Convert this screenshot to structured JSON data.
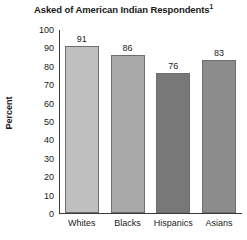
{
  "chart_data": {
    "type": "bar",
    "title": "Asked of American Indian Respondents",
    "title_superscript": "1",
    "categories": [
      "Whites",
      "Blacks",
      "Hispanics",
      "Asians"
    ],
    "values": [
      91,
      86,
      76,
      83
    ],
    "xlabel": "",
    "ylabel": "Percent",
    "ylim": [
      0,
      100
    ],
    "yticks": [
      100,
      90,
      80,
      70,
      60,
      50,
      40,
      30,
      20,
      10,
      0
    ],
    "grid": false,
    "legend": false,
    "bar_colors": [
      "#bfbfbf",
      "#a8a8a8",
      "#787878",
      "#8c8c8c"
    ],
    "bar_border_color": "#6e6e6e",
    "axis_color": "#3a3a3a",
    "text_color": "#1a1a1a",
    "background_color": "#ffffff"
  }
}
